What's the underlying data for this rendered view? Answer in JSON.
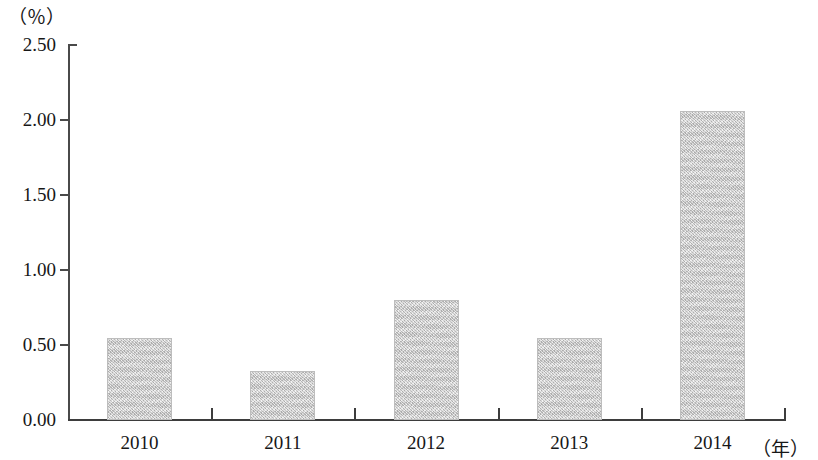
{
  "chart_data": {
    "type": "bar",
    "title": "",
    "subtitle": "",
    "xlabel": "（年）",
    "ylabel": "（％）",
    "categories": [
      "2010",
      "2011",
      "2012",
      "2013",
      "2014"
    ],
    "values": [
      0.55,
      0.33,
      0.8,
      0.55,
      2.06
    ],
    "series": [
      {
        "name": "",
        "values": [
          0.55,
          0.33,
          0.8,
          0.55,
          2.06
        ]
      }
    ],
    "ylim": [
      0.0,
      2.5
    ],
    "ytick_labels": [
      "0.00",
      "0.50",
      "1.00",
      "1.50",
      "2.00",
      "2.50"
    ],
    "ytick_values": [
      0.0,
      0.5,
      1.0,
      1.5,
      2.0,
      2.5
    ],
    "grid": false,
    "legend": false,
    "legend_position": "none",
    "bar_color": "#c9c9c9",
    "axis_color": "#3d3d3d",
    "text_color": "#171717",
    "annotations": []
  }
}
